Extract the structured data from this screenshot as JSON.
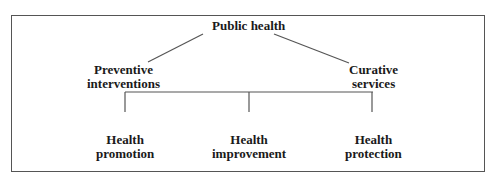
{
  "diagram": {
    "root": {
      "label": "Public health"
    },
    "level1": [
      {
        "lines": [
          "Preventive",
          "interventions"
        ]
      },
      {
        "lines": [
          "Curative",
          "services"
        ]
      }
    ],
    "level2": [
      {
        "lines": [
          "Health",
          "promotion"
        ]
      },
      {
        "lines": [
          "Health",
          "improvement"
        ]
      },
      {
        "lines": [
          "Health",
          "protection"
        ]
      }
    ],
    "edges": [
      [
        "Public health",
        "Preventive interventions"
      ],
      [
        "Public health",
        "Curative services"
      ],
      [
        "Preventive interventions",
        "Health promotion"
      ],
      [
        "Preventive interventions",
        "Health improvement"
      ],
      [
        "Preventive interventions",
        "Health protection"
      ]
    ],
    "colors": {
      "line": "#555555",
      "text": "#1a1a1a",
      "background": "#ffffff"
    }
  }
}
